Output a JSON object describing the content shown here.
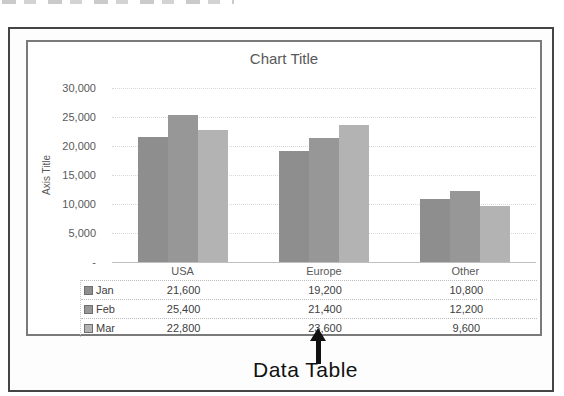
{
  "page": {
    "annotation_label": "Data Table"
  },
  "chart_data": {
    "type": "bar",
    "title": "Chart Title",
    "xlabel": "",
    "ylabel": "Axis Title",
    "categories": [
      "USA",
      "Europe",
      "Other"
    ],
    "series": [
      {
        "name": "Jan",
        "color": "#8e8e8e",
        "values": [
          21600,
          19200,
          10800
        ]
      },
      {
        "name": "Feb",
        "color": "#979797",
        "values": [
          25400,
          21400,
          12200
        ]
      },
      {
        "name": "Mar",
        "color": "#b3b3b3",
        "values": [
          22800,
          23600,
          9600
        ]
      }
    ],
    "ylim": [
      0,
      30000
    ],
    "ytick_step": 5000,
    "ytick_labels_top_to_bottom": [
      "30,000",
      "25,000",
      "20,000",
      "15,000",
      "10,000",
      "5,000",
      "-"
    ],
    "grid": true,
    "legend_position": "data-table",
    "data_table": {
      "shown": true,
      "row_headers": [
        "Jan",
        "Feb",
        "Mar"
      ],
      "col_headers": [
        "USA",
        "Europe",
        "Other"
      ],
      "cells": [
        [
          "21,600",
          "19,200",
          "10,800"
        ],
        [
          "25,400",
          "21,400",
          "12,200"
        ],
        [
          "22,800",
          "23,600",
          "9,600"
        ]
      ]
    }
  }
}
